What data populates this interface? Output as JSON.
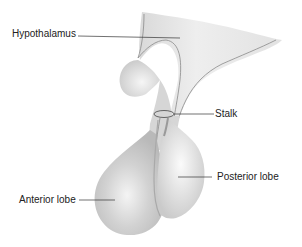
{
  "diagram": {
    "labels": {
      "hypothalamus": "Hypothalamus",
      "stalk": "Stalk",
      "posterior_lobe": "Posterior lobe",
      "anterior_lobe": "Anterior lobe"
    },
    "colors": {
      "background": "#ffffff",
      "tissue_light": "#e6e6e6",
      "tissue_mid": "#cfcfcf",
      "tissue_dark": "#b8b8b8",
      "outline": "#8a8a8a",
      "leader_line": "#333333",
      "text": "#222222"
    }
  }
}
